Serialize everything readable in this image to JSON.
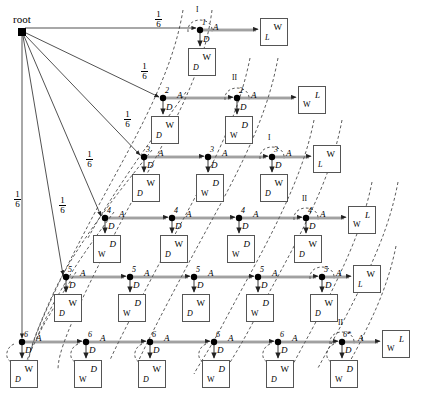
{
  "diagram": {
    "title_text": "root",
    "root": {
      "label": "root",
      "x": 22,
      "y": 31,
      "size": 7
    },
    "branch_probability": "1/6",
    "branch_prob_num": "1",
    "branch_prob_den": "6",
    "action_labels": {
      "advance": "A",
      "down": "D"
    },
    "glyphs": {
      "w": "ᵂ",
      "d": "ᵈ",
      "l": "ℒ"
    },
    "symbol_w": "W",
    "symbol_d": "D",
    "symbol_l": "L",
    "roman_one": "I",
    "roman_two": "II",
    "star_marker": "*",
    "rows": [
      {
        "index": 1,
        "node_label": "1",
        "y": 31,
        "xs": [
          200
        ],
        "last_roman": "I",
        "terminal": {
          "x": 262,
          "y": 20,
          "top": "W",
          "bottom": "L",
          "order": "w-top"
        },
        "down_boxes": [
          {
            "x": 188,
            "y": 48,
            "top": "W",
            "bottom": "D",
            "order": "w-top"
          }
        ]
      },
      {
        "index": 2,
        "node_label": "2",
        "y": 99,
        "xs": [
          163,
          237
        ],
        "last_roman": "II",
        "terminal": {
          "x": 300,
          "y": 88,
          "top": "L",
          "bottom": "W",
          "order": "l-top"
        },
        "down_boxes": [
          {
            "x": 151,
            "y": 116,
            "top": "W",
            "bottom": "D",
            "order": "w-top"
          },
          {
            "x": 225,
            "y": 116,
            "top": "D",
            "bottom": "W",
            "order": "d-top"
          }
        ]
      },
      {
        "index": 3,
        "node_label": "3",
        "y": 158,
        "xs": [
          144,
          208,
          272
        ],
        "last_roman": "I",
        "terminal": {
          "x": 315,
          "y": 150,
          "top": "W",
          "bottom": "L",
          "order": "w-top"
        },
        "down_boxes": [
          {
            "x": 132,
            "y": 174,
            "top": "W",
            "bottom": "D",
            "order": "w-top"
          },
          {
            "x": 196,
            "y": 174,
            "top": "D",
            "bottom": "W",
            "order": "d-top"
          },
          {
            "x": 260,
            "y": 174,
            "top": "W",
            "bottom": "D",
            "order": "w-top"
          }
        ]
      },
      {
        "index": 4,
        "node_label": "4",
        "y": 219,
        "xs": [
          105,
          172,
          239,
          306
        ],
        "last_roman": "II",
        "terminal": {
          "x": 350,
          "y": 210,
          "top": "L",
          "bottom": "W",
          "order": "l-top"
        },
        "down_boxes": [
          {
            "x": 93,
            "y": 235,
            "top": "D",
            "bottom": "W",
            "order": "d-top"
          },
          {
            "x": 160,
            "y": 235,
            "top": "W",
            "bottom": "D",
            "order": "w-top"
          },
          {
            "x": 227,
            "y": 235,
            "top": "D",
            "bottom": "W",
            "order": "d-top"
          },
          {
            "x": 294,
            "y": 235,
            "top": "W",
            "bottom": "D",
            "order": "w-top"
          }
        ]
      },
      {
        "index": 5,
        "node_label": "5",
        "y": 278,
        "xs": [
          66,
          130,
          194,
          258,
          322
        ],
        "last_roman": "I",
        "terminal": {
          "x": 355,
          "y": 270,
          "top": "W",
          "bottom": "L",
          "order": "w-top"
        },
        "down_boxes": [
          {
            "x": 54,
            "y": 294,
            "top": "W",
            "bottom": "D",
            "order": "w-top"
          },
          {
            "x": 118,
            "y": 294,
            "top": "D",
            "bottom": "W",
            "order": "d-top"
          },
          {
            "x": 182,
            "y": 294,
            "top": "W",
            "bottom": "D",
            "order": "w-top"
          },
          {
            "x": 246,
            "y": 294,
            "top": "D",
            "bottom": "W",
            "order": "d-top"
          },
          {
            "x": 310,
            "y": 294,
            "top": "W",
            "bottom": "D",
            "order": "w-top"
          }
        ]
      },
      {
        "index": 6,
        "node_label": "6",
        "y": 343,
        "xs": [
          22,
          86,
          150,
          214,
          278,
          342
        ],
        "last_roman": "II",
        "last_node_label": "6*",
        "terminal": {
          "x": 384,
          "y": 335,
          "top": "L",
          "bottom": "W",
          "order": "l-top"
        },
        "down_boxes": [
          {
            "x": 10,
            "y": 360,
            "top": "W",
            "bottom": "D",
            "order": "w-top"
          },
          {
            "x": 74,
            "y": 360,
            "top": "D",
            "bottom": "W",
            "order": "d-top"
          },
          {
            "x": 138,
            "y": 360,
            "top": "W",
            "bottom": "D",
            "order": "w-top"
          },
          {
            "x": 202,
            "y": 360,
            "top": "D",
            "bottom": "W",
            "order": "d-top"
          },
          {
            "x": 266,
            "y": 360,
            "top": "W",
            "bottom": "D",
            "order": "w-top"
          },
          {
            "x": 330,
            "y": 360,
            "top": "D",
            "bottom": "W",
            "order": "d-top"
          }
        ]
      }
    ],
    "branch_labels": [
      {
        "text_num": "1",
        "text_den": "6",
        "x": 158,
        "y": 14
      },
      {
        "text_num": "1",
        "text_den": "6",
        "x": 140,
        "y": 64
      },
      {
        "text_num": "1",
        "text_den": "6",
        "x": 120,
        "y": 110
      },
      {
        "text_num": "1",
        "text_den": "6",
        "x": 80,
        "y": 150
      },
      {
        "text_num": "1",
        "text_den": "6",
        "x": 52,
        "y": 192
      },
      {
        "text_num": "1",
        "text_den": "6",
        "x": 16,
        "y": 190
      }
    ],
    "colors": {
      "ink": "#000000",
      "box_border": "#555555",
      "dashed": "#444444",
      "edge": "#555555"
    }
  }
}
